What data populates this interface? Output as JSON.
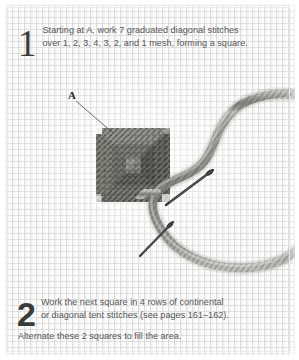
{
  "page": {
    "background_color": "#fdfdfd",
    "frame_color": "#e4e4e2",
    "text_color": "#56565a",
    "numeral_color": "#3a3a38"
  },
  "steps": [
    {
      "number": "1",
      "line1": "Starting at A, work 7 graduated diagonal stitches",
      "line2": "over 1, 2, 3, 4, 3, 2, and 1 mesh, forming a square."
    },
    {
      "number": "2",
      "line1": "Work the next square in 4 rows of continental",
      "line2": "or diagonal tent stitches (see pages 161–162).",
      "line3": "Alternate these 2 squares to fill the area."
    }
  ],
  "illustration": {
    "callout_label": "A",
    "canvas_color": "#fdfdfd",
    "mesh_line_color": "#d8d8d6",
    "yarn_color": "#8e8d88",
    "yarn_highlight": "#b9b8b3",
    "yarn_shadow": "#6e6d68",
    "stitch_color": "#7b7a74",
    "stitch_dark": "#5c5b56",
    "needle_color": "#3a3a3c",
    "leader_line_color": "#4a4a4a"
  }
}
